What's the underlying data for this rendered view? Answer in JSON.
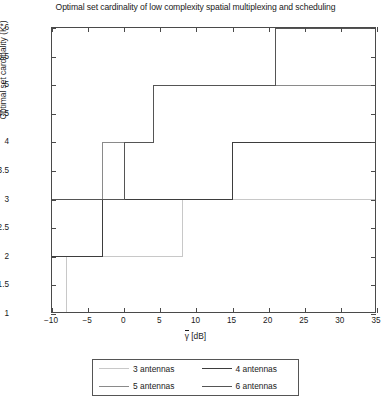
{
  "chart_data": {
    "type": "line",
    "title": "Optimal set cardinality of low complexity spatial multiplexing and scheduling",
    "xlabel": "γ̄ [dB]",
    "xlabel_symbol": "γ",
    "xlabel_unit": " [dB]",
    "ylabel": "Optimal set cardinality (K*)",
    "xlim": [
      -10,
      35
    ],
    "ylim": [
      1,
      6
    ],
    "xticks": [
      -10,
      -5,
      0,
      5,
      10,
      15,
      20,
      25,
      30,
      35
    ],
    "xticklabels": [
      "−10",
      "−5",
      "0",
      "5",
      "10",
      "15",
      "20",
      "25",
      "30",
      "35"
    ],
    "yticks": [
      1,
      1.5,
      2,
      2.5,
      3,
      3.5,
      4,
      4.5,
      5,
      5.5,
      6
    ],
    "yticklabels": [
      "1",
      "1.5",
      "2",
      "2.5",
      "3",
      "3.5",
      "4",
      "4.5",
      "5",
      "5.5",
      "6"
    ],
    "grid": false,
    "drawstyle": "steps-post",
    "legend_position": "below-center",
    "series": [
      {
        "name": "3 antennas",
        "color": "#c8c8c8",
        "width": 1.0,
        "points": [
          [
            -10,
            1
          ],
          [
            -8,
            1
          ],
          [
            -8,
            2
          ],
          [
            8,
            2
          ],
          [
            8,
            3
          ],
          [
            35,
            3
          ]
        ]
      },
      {
        "name": "4 antennas",
        "color": "#3d3d3d",
        "width": 1.2,
        "points": [
          [
            -10,
            2
          ],
          [
            -3,
            2
          ],
          [
            -3,
            3
          ],
          [
            15,
            3
          ],
          [
            15,
            4
          ],
          [
            35,
            4
          ]
        ]
      },
      {
        "name": "5 antennas",
        "color": "#8a8a8a",
        "width": 1.0,
        "points": [
          [
            -10,
            3
          ],
          [
            -3,
            3
          ],
          [
            -3,
            4
          ],
          [
            4,
            4
          ],
          [
            4,
            5
          ],
          [
            21,
            5
          ],
          [
            21,
            5
          ],
          [
            35,
            5
          ]
        ]
      },
      {
        "name": "6 antennas",
        "color": "#555555",
        "width": 1.2,
        "points": [
          [
            -10,
            3
          ],
          [
            0,
            3
          ],
          [
            0,
            4
          ],
          [
            4,
            4
          ],
          [
            4,
            5
          ],
          [
            21,
            5
          ],
          [
            21,
            6
          ],
          [
            35,
            6
          ]
        ]
      }
    ]
  },
  "legend": {
    "items": [
      {
        "label": "3 antennas",
        "color": "#c8c8c8"
      },
      {
        "label": "4 antennas",
        "color": "#3d3d3d"
      },
      {
        "label": "5 antennas",
        "color": "#8a8a8a"
      },
      {
        "label": "6 antennas",
        "color": "#555555"
      }
    ]
  }
}
